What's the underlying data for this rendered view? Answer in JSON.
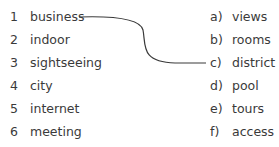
{
  "exercise": {
    "left_items": [
      {
        "number": "1",
        "word": "business"
      },
      {
        "number": "2",
        "word": "indoor"
      },
      {
        "number": "3",
        "word": "sightseeing"
      },
      {
        "number": "4",
        "word": "city"
      },
      {
        "number": "5",
        "word": "internet"
      },
      {
        "number": "6",
        "word": "meeting"
      }
    ],
    "right_items": [
      {
        "letter": "a)",
        "word": "views"
      },
      {
        "letter": "b)",
        "word": "rooms"
      },
      {
        "letter": "c)",
        "word": "district"
      },
      {
        "letter": "d)",
        "word": "pool"
      },
      {
        "letter": "e)",
        "word": "tours"
      },
      {
        "letter": "f)",
        "word": "access"
      }
    ],
    "example_match": {
      "from": "1",
      "to": "c)"
    }
  }
}
